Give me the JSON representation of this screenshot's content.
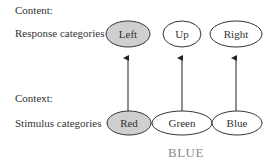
{
  "labels": {
    "content": "Content:",
    "response_categories": "Response categories",
    "context": "Context:",
    "stimulus_categories": "Stimulus categories"
  },
  "responses": [
    {
      "label": "Left",
      "highlighted": true
    },
    {
      "label": "Up",
      "highlighted": false
    },
    {
      "label": "Right",
      "highlighted": false
    }
  ],
  "stimuli": [
    {
      "label": "Red",
      "highlighted": true
    },
    {
      "label": "Green",
      "highlighted": false
    },
    {
      "label": "Blue",
      "highlighted": false
    }
  ],
  "word": "BLUE",
  "colors": {
    "highlight": "#cfcfcf",
    "stroke": "#333333",
    "word": "#888888"
  }
}
